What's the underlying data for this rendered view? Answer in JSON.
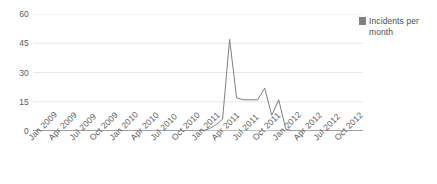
{
  "chart_data": {
    "type": "line",
    "title": "",
    "xlabel": "",
    "ylabel": "",
    "ylim": [
      0,
      60
    ],
    "yticks": [
      0,
      15,
      30,
      45,
      60
    ],
    "grid": true,
    "legend_position": "right",
    "legend": [
      "Incidents per month"
    ],
    "series_color": "#808080",
    "x_tick_labels": [
      "Jan 2009",
      "Apr 2009",
      "Jul 2009",
      "Oct 2009",
      "Jan 2010",
      "Apr 2010",
      "Jul 2010",
      "Oct 2010",
      "Jan 2011",
      "Apr 2011",
      "Jul 2011",
      "Oct 2011",
      "Jan 2012",
      "Apr 2012",
      "Jul 2012",
      "Oct 2012"
    ],
    "x": [
      "Jan 2009",
      "Feb 2009",
      "Mar 2009",
      "Apr 2009",
      "May 2009",
      "Jun 2009",
      "Jul 2009",
      "Aug 2009",
      "Sep 2009",
      "Oct 2009",
      "Nov 2009",
      "Dec 2009",
      "Jan 2010",
      "Feb 2010",
      "Mar 2010",
      "Apr 2010",
      "May 2010",
      "Jun 2010",
      "Jul 2010",
      "Aug 2010",
      "Sep 2010",
      "Oct 2010",
      "Nov 2010",
      "Dec 2010",
      "Jan 2011",
      "Feb 2011",
      "Mar 2011",
      "Apr 2011",
      "May 2011",
      "Jun 2011",
      "Jul 2011",
      "Aug 2011",
      "Sep 2011",
      "Oct 2011",
      "Nov 2011",
      "Dec 2011",
      "Jan 2012",
      "Feb 2012",
      "Mar 2012",
      "Apr 2012",
      "May 2012",
      "Jun 2012",
      "Jul 2012",
      "Aug 2012",
      "Sep 2012",
      "Oct 2012",
      "Nov 2012",
      "Dec 2012"
    ],
    "series": [
      {
        "name": "Incidents per month",
        "values": [
          0,
          0,
          0,
          0,
          0,
          0,
          0,
          0,
          0,
          0,
          0,
          0,
          0,
          0,
          0,
          0,
          0,
          0,
          0,
          0,
          0,
          0,
          0,
          0,
          0,
          1,
          3,
          6,
          47,
          17,
          16,
          16,
          16,
          22,
          8,
          16,
          1,
          0,
          0,
          0,
          0,
          0,
          0,
          0,
          0,
          0,
          0,
          0
        ]
      }
    ]
  },
  "legend": {
    "label": "Incidents per month"
  }
}
